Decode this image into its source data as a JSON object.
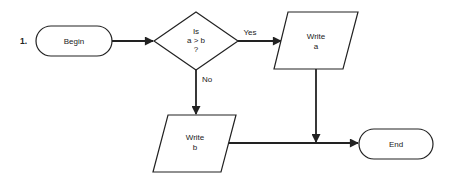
{
  "diagram": {
    "step_number": "1.",
    "nodes": {
      "begin": {
        "label": "Begin",
        "shape": "terminator"
      },
      "decision": {
        "line1": "Is",
        "line2": "a > b",
        "line3": "?",
        "shape": "diamond"
      },
      "write_a": {
        "line1": "Write",
        "line2": "a",
        "shape": "parallelogram"
      },
      "write_b": {
        "line1": "Write",
        "line2": "b",
        "shape": "parallelogram"
      },
      "end": {
        "label": "End",
        "shape": "terminator"
      }
    },
    "edges": {
      "yes_label": "Yes",
      "no_label": "No"
    },
    "colors": {
      "stroke": "#222222",
      "background": "#ffffff"
    }
  }
}
